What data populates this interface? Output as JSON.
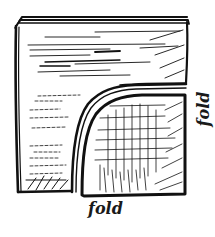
{
  "figure": {
    "ink_color": "#111111",
    "background_color": "#ffffff",
    "labels": {
      "bottom": "fold",
      "right": "fold"
    },
    "regions": [
      {
        "name": "top-folded-panel",
        "hatching": "horizontal"
      },
      {
        "name": "left-folded-panel",
        "hatching": "horizontal"
      },
      {
        "name": "inner-corner-panel",
        "hatching": "crosshatch"
      }
    ]
  }
}
